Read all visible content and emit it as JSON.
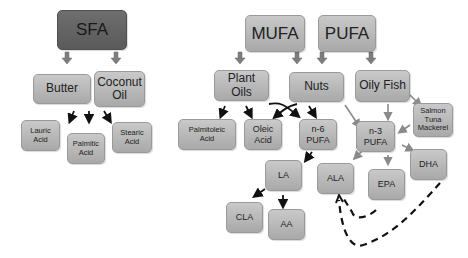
{
  "diagram": {
    "type": "fatty-acid-classification",
    "nodes": {
      "sfa": "SFA",
      "mufa": "MUFA",
      "pufa": "PUFA",
      "butter": "Butter",
      "coconut_oil_1": "Coconut",
      "coconut_oil_2": "Oil",
      "plant_oils_1": "Plant",
      "plant_oils_2": "Oils",
      "nuts": "Nuts",
      "oily_fish": "Oily Fish",
      "salmon_1": "Salmon",
      "salmon_2": "Tuna",
      "salmon_3": "Mackerel",
      "lauric_1": "Lauric",
      "lauric_2": "Acid",
      "palmitic_1": "Palmitic",
      "palmitic_2": "Acid",
      "stearic_1": "Stearic",
      "stearic_2": "Acid",
      "palmitoleic_1": "Palmitoleic",
      "palmitoleic_2": "Acid",
      "oleic_1": "Oleic",
      "oleic_2": "Acid",
      "n6_1": "n-6",
      "n6_2": "PUFA",
      "n3_1": "n-3",
      "n3_2": "PUFA",
      "la": "LA",
      "cla": "CLA",
      "aa": "AA",
      "ala": "ALA",
      "epa": "EPA",
      "dha": "DHA"
    },
    "edges": [
      {
        "from": "SFA",
        "to": "Butter",
        "style": "block-arrow"
      },
      {
        "from": "SFA",
        "to": "Coconut Oil",
        "style": "block-arrow"
      },
      {
        "from": "Butter/Coconut Oil",
        "to": "Lauric Acid",
        "style": "arrow"
      },
      {
        "from": "Butter/Coconut Oil",
        "to": "Palmitic Acid",
        "style": "arrow"
      },
      {
        "from": "Butter/Coconut Oil",
        "to": "Stearic Acid",
        "style": "arrow"
      },
      {
        "from": "MUFA",
        "to": "Plant Oils",
        "style": "block-arrow"
      },
      {
        "from": "MUFA",
        "to": "Nuts",
        "style": "block-arrow"
      },
      {
        "from": "PUFA",
        "to": "Nuts",
        "style": "block-arrow"
      },
      {
        "from": "PUFA",
        "to": "Oily Fish",
        "style": "block-arrow"
      },
      {
        "from": "Plant Oils",
        "to": "Palmitoleic Acid",
        "style": "arrow"
      },
      {
        "from": "Plant Oils",
        "to": "Oleic Acid",
        "style": "arrow"
      },
      {
        "from": "Plant Oils",
        "to": "n-6 PUFA",
        "style": "arrow"
      },
      {
        "from": "Nuts",
        "to": "Oleic Acid",
        "style": "arrow"
      },
      {
        "from": "Nuts",
        "to": "n-6 PUFA",
        "style": "arrow"
      },
      {
        "from": "Nuts",
        "to": "n-3 PUFA",
        "style": "gray-arrow"
      },
      {
        "from": "Oily Fish",
        "to": "n-3 PUFA",
        "style": "gray-arrow"
      },
      {
        "from": "Oily Fish",
        "to": "Salmon Tuna Mackerel",
        "style": "gray-arrow"
      },
      {
        "from": "Salmon Tuna Mackerel",
        "to": "n-3 PUFA",
        "style": "gray-arrow"
      },
      {
        "from": "n-6 PUFA",
        "to": "LA",
        "style": "arrow"
      },
      {
        "from": "LA",
        "to": "CLA",
        "style": "arrow"
      },
      {
        "from": "LA",
        "to": "AA",
        "style": "arrow"
      },
      {
        "from": "n-3 PUFA",
        "to": "ALA",
        "style": "gray-arrow"
      },
      {
        "from": "n-3 PUFA",
        "to": "EPA",
        "style": "gray-arrow"
      },
      {
        "from": "n-3 PUFA",
        "to": "DHA",
        "style": "gray-arrow"
      },
      {
        "from": "EPA",
        "to": "ALA",
        "style": "dashed"
      },
      {
        "from": "DHA",
        "to": "ALA",
        "style": "dashed"
      }
    ],
    "colors": {
      "node_fill": "#b9b9b9",
      "root_sfa_fill": "#646464",
      "arrow_black": "#111111",
      "arrow_gray": "#8a8a8a",
      "block_arrow": "#7a7a7a"
    }
  }
}
